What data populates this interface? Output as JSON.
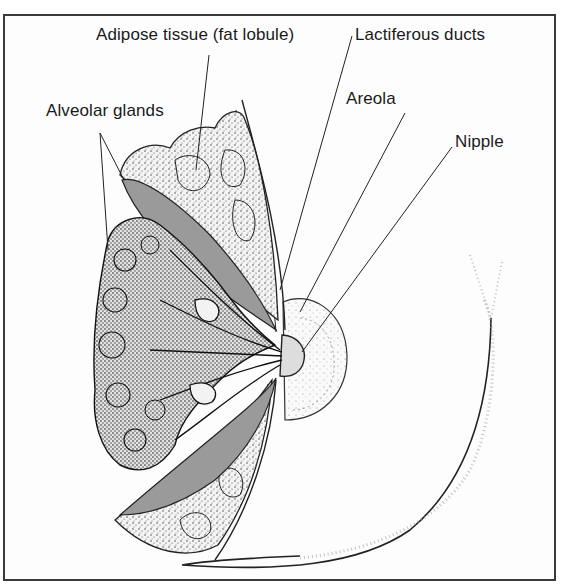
{
  "diagram": {
    "labels": {
      "adipose": "Adipose tissue (fat lobule)",
      "lactiferous": "Lactiferous ducts",
      "areola": "Areola",
      "alveolar": "Alveolar glands",
      "nipple": "Nipple"
    },
    "colors": {
      "frame": "#3a3a3a",
      "ink": "#1a1a1a",
      "duct_fill": "#9a9a9a",
      "background": "#ffffff"
    }
  }
}
